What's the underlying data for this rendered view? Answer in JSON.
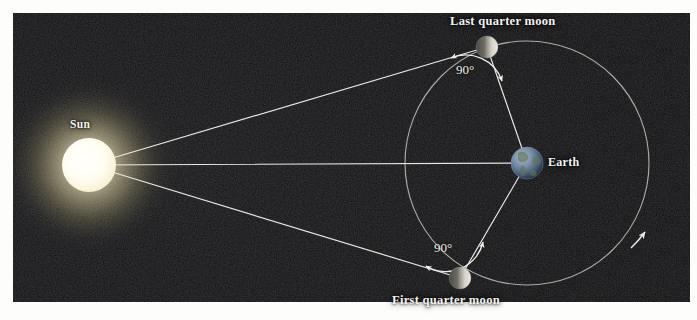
{
  "figure": {
    "background_color": "#0a0a0e",
    "border_color": "#fdfdfb",
    "line_color": "#e8e8e4",
    "orbit_color": "#b9b9b4"
  },
  "labels": {
    "sun": "Sun",
    "earth": "Earth",
    "last_quarter_moon": "Last quarter moon",
    "first_quarter_moon": "First quarter moon",
    "angle_last_quarter": "90°",
    "angle_first_quarter": "90°"
  },
  "bodies": {
    "sun": {
      "name": "Sun",
      "cx": 89,
      "cy": 165,
      "r": 27,
      "color": "#fffdf0",
      "glow_color": "#fff8d8"
    },
    "earth": {
      "name": "Earth",
      "cx": 527,
      "cy": 163,
      "r": 16,
      "color": "#8fa8c4"
    },
    "last_quarter_moon": {
      "name": "Last quarter moon",
      "cx": 487,
      "cy": 47,
      "r": 11,
      "color": "#c8c6c0"
    },
    "first_quarter_moon": {
      "name": "First quarter moon",
      "cx": 460,
      "cy": 278,
      "r": 11,
      "color": "#c8c6c0"
    }
  },
  "orbit": {
    "cx": 527,
    "cy": 163,
    "r": 122,
    "direction": "counterclockwise",
    "arrow_position": {
      "x": 640,
      "y": 237
    }
  },
  "sight_lines": [
    {
      "name": "sun-to-last-quarter-moon",
      "from": "sun",
      "to": "last_quarter_moon"
    },
    {
      "name": "sun-to-earth",
      "from": "sun",
      "to": "earth"
    },
    {
      "name": "sun-to-first-quarter-moon",
      "from": "sun",
      "to": "first_quarter_moon"
    }
  ],
  "earth_lines": [
    {
      "name": "earth-to-last-quarter-moon",
      "from": "earth",
      "to": "last_quarter_moon"
    },
    {
      "name": "earth-to-first-quarter-moon",
      "from": "earth",
      "to": "first_quarter_moon"
    }
  ],
  "angles": [
    {
      "name": "angle-at-last-quarter-moon",
      "value": "90°",
      "at": "last_quarter_moon"
    },
    {
      "name": "angle-at-first-quarter-moon",
      "value": "90°",
      "at": "first_quarter_moon"
    }
  ]
}
